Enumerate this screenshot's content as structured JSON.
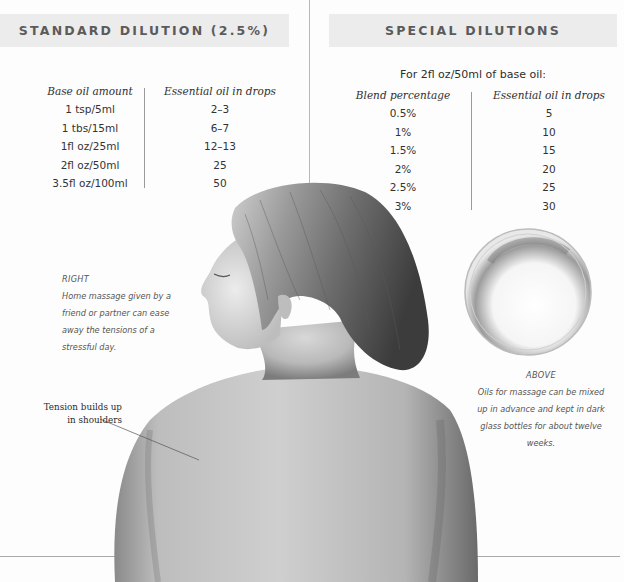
{
  "standard_dilution": {
    "title": "STANDARD DILUTION (2.5%)",
    "columns": [
      "Base oil amount",
      "Essential oil in drops"
    ],
    "rows": [
      [
        "1 tsp/5ml",
        "2–3"
      ],
      [
        "1 tbs/15ml",
        "6–7"
      ],
      [
        "1fl oz/25ml",
        "12–13"
      ],
      [
        "2fl oz/50ml",
        "25"
      ],
      [
        "3.5fl oz/100ml",
        "50"
      ]
    ]
  },
  "special_dilutions": {
    "title": "SPECIAL DILUTIONS",
    "subtitle": "For 2fl oz/50ml of base oil:",
    "columns": [
      "Blend percentage",
      "Essential oil in drops"
    ],
    "rows": [
      [
        "0.5%",
        "5"
      ],
      [
        "1%",
        "10"
      ],
      [
        "1.5%",
        "15"
      ],
      [
        "2%",
        "20"
      ],
      [
        "2.5%",
        "25"
      ],
      [
        "3%",
        "30"
      ]
    ]
  },
  "captions": {
    "right": {
      "label": "RIGHT",
      "text": "Home massage given by a friend or partner can ease away the tensions of a stressful day."
    },
    "above": {
      "label": "ABOVE",
      "text": "Oils for massage can be mixed up in advance and kept in dark glass bottles for about twelve weeks."
    }
  },
  "annotation": {
    "line1": "Tension builds up",
    "line2": "in shoulders"
  },
  "images": {
    "woman_back": "photo of woman's bare back and head in profile",
    "oil_dish": "glass dish of massage oil"
  }
}
